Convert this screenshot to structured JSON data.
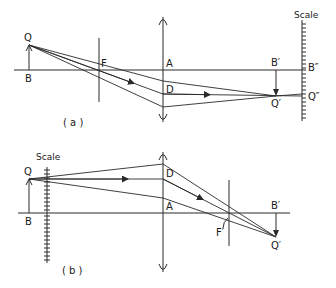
{
  "figure": {
    "panel_a": {
      "caption": "( a )",
      "labels": {
        "object_tip": "Q",
        "object_base": "B",
        "focus": "F",
        "lens_axis_point": "A",
        "lens_point": "D",
        "image_base": "B′",
        "image_tip": "Q′",
        "scale_base": "B″",
        "scale_tip": "Q″",
        "scale_title": "Scale"
      }
    },
    "panel_b": {
      "caption": "( b )",
      "labels": {
        "scale_title": "Scale",
        "object_tip": "Q",
        "object_base": "B",
        "lens_point": "D",
        "lens_axis_point": "A",
        "focus": "F′",
        "image_base": "B′",
        "image_tip": "Q′"
      }
    }
  }
}
